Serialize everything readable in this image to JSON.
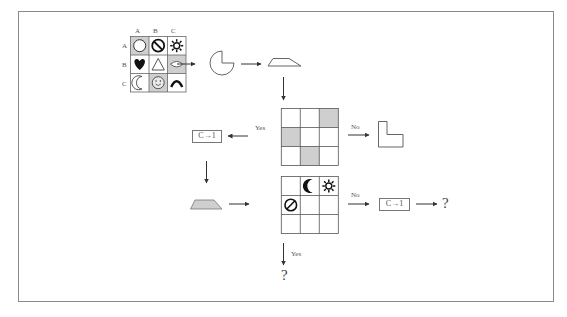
{
  "diagram": {
    "frame_color": "#8a8a8a",
    "cell_shade_color": "#cfcfcf",
    "line_color": "#444444",
    "source_grid": {
      "column_headers": [
        "A",
        "B",
        "C"
      ],
      "row_headers": [
        "A",
        "B",
        "C"
      ],
      "cells": [
        [
          {
            "symbol": "circle-outline",
            "shaded": true
          },
          {
            "symbol": "prohibited",
            "shaded": false
          },
          {
            "symbol": "sun",
            "shaded": false
          }
        ],
        [
          {
            "symbol": "heart-filled",
            "shaded": false
          },
          {
            "symbol": "triangle-outline",
            "shaded": false
          },
          {
            "symbol": "eye-diamond",
            "shaded": true
          }
        ],
        [
          {
            "symbol": "crescent-outline",
            "shaded": false
          },
          {
            "symbol": "smiley",
            "shaded": true
          },
          {
            "symbol": "arch",
            "shaded": false
          }
        ]
      ]
    },
    "pie_shape": "circle-missing-quarter",
    "trapezoid_outline": "trapezoid-outline",
    "middle_grid": {
      "shaded_cells": [
        [
          0,
          2
        ],
        [
          1,
          0
        ],
        [
          2,
          1
        ]
      ]
    },
    "middle_branch": {
      "yes_label": "Yes",
      "no_label": "No",
      "yes_box": "C→1",
      "no_shape": "L-shape"
    },
    "lower_trapezoid": "trapezoid-filled",
    "bottom_grid": {
      "symbols": [
        {
          "row": 0,
          "col": 1,
          "symbol": "crescent-filled"
        },
        {
          "row": 0,
          "col": 2,
          "symbol": "sun"
        },
        {
          "row": 1,
          "col": 0,
          "symbol": "prohibited"
        }
      ]
    },
    "bottom_branch": {
      "no_label": "No",
      "no_box": "C→1",
      "no_result": "?",
      "yes_label": "Yes",
      "yes_result": "?"
    }
  }
}
